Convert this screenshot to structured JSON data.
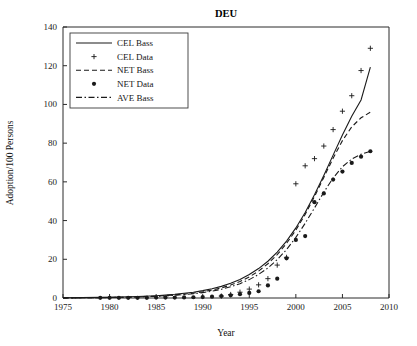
{
  "figure": {
    "title": "DEU",
    "background": "#ffffff",
    "ink": "#1a1a1a"
  },
  "chart_data": {
    "type": "line",
    "title": "DEU",
    "xlabel": "Year",
    "ylabel": "Adoption/100 Persons",
    "xlim": [
      1975,
      2010
    ],
    "ylim": [
      0,
      140
    ],
    "xticks": [
      1975,
      1980,
      1985,
      1990,
      1995,
      2000,
      2005,
      2010
    ],
    "yticks": [
      0,
      20,
      40,
      60,
      80,
      100,
      120,
      140
    ],
    "grid": false,
    "legend_position": "top-left",
    "series": [
      {
        "name": "CEL Bass",
        "style": "solid",
        "marker": "none",
        "x": [
          1975,
          1977,
          1979,
          1981,
          1983,
          1985,
          1987,
          1989,
          1990,
          1991,
          1992,
          1993,
          1994,
          1995,
          1996,
          1997,
          1998,
          1999,
          2000,
          2001,
          2002,
          2003,
          2004,
          2005,
          2006,
          2007,
          2008
        ],
        "values": [
          0.1,
          0.2,
          0.3,
          0.5,
          0.8,
          1.2,
          1.9,
          3.0,
          3.8,
          4.8,
          6.0,
          7.6,
          9.6,
          12.1,
          15.2,
          19.0,
          23.7,
          29.4,
          36.2,
          44.2,
          53.3,
          63.3,
          73.8,
          84.2,
          93.9,
          102.3,
          119.3
        ]
      },
      {
        "name": "CEL Data",
        "style": "none",
        "marker": "plus",
        "x": [
          1992,
          1993,
          1994,
          1995,
          1996,
          1997,
          1998,
          1999,
          2000,
          2001,
          2002,
          2003,
          2004,
          2005,
          2006,
          2007,
          2008
        ],
        "values": [
          1.0,
          1.8,
          3.0,
          4.6,
          6.8,
          10.0,
          17.0,
          21.0,
          59.0,
          68.3,
          72.0,
          78.5,
          87.0,
          96.5,
          104.5,
          117.5,
          129.0
        ]
      },
      {
        "name": "NET Bass",
        "style": "dashed",
        "marker": "none",
        "x": [
          1975,
          1977,
          1979,
          1981,
          1983,
          1985,
          1987,
          1989,
          1990,
          1991,
          1992,
          1993,
          1994,
          1995,
          1996,
          1997,
          1998,
          1999,
          2000,
          2001,
          2002,
          2003,
          2004,
          2005,
          2006,
          2007,
          2008
        ],
        "values": [
          0.05,
          0.1,
          0.2,
          0.35,
          0.6,
          1.0,
          1.6,
          2.5,
          3.2,
          4.1,
          5.2,
          6.7,
          8.5,
          10.9,
          13.9,
          17.7,
          22.4,
          28.2,
          35.1,
          43.2,
          52.4,
          62.3,
          72.2,
          81.3,
          88.4,
          93.1,
          96.0
        ]
      },
      {
        "name": "NET Data",
        "style": "none",
        "marker": "dot",
        "x": [
          1979,
          1980,
          1981,
          1982,
          1983,
          1984,
          1985,
          1986,
          1987,
          1988,
          1989,
          1990,
          1991,
          1992,
          1993,
          1994,
          1995,
          1996,
          1997,
          1998,
          1999,
          2000,
          2001,
          2002,
          2003,
          2004,
          2005,
          2006,
          2007,
          2008
        ],
        "values": [
          0.1,
          0.1,
          0.1,
          0.1,
          0.1,
          0.1,
          0.2,
          0.2,
          0.2,
          0.3,
          0.4,
          0.5,
          0.7,
          1.0,
          1.4,
          2.0,
          2.6,
          3.5,
          6.5,
          10.0,
          20.5,
          30.0,
          32.0,
          49.5,
          54.0,
          61.2,
          65.3,
          69.8,
          73.0,
          75.8
        ]
      },
      {
        "name": "AVE Bass",
        "style": "dashdot",
        "marker": "none",
        "x": [
          1975,
          1977,
          1979,
          1981,
          1983,
          1985,
          1987,
          1989,
          1990,
          1991,
          1992,
          1993,
          1994,
          1995,
          1996,
          1997,
          1998,
          1999,
          2000,
          2001,
          2002,
          2003,
          2004,
          2005,
          2006,
          2007,
          2008
        ],
        "values": [
          0.05,
          0.1,
          0.15,
          0.3,
          0.5,
          0.85,
          1.4,
          2.2,
          2.8,
          3.5,
          4.5,
          5.8,
          7.4,
          9.5,
          12.2,
          15.5,
          19.8,
          25.0,
          31.3,
          38.6,
          46.5,
          54.6,
          62.0,
          67.8,
          71.8,
          74.3,
          75.8
        ]
      }
    ]
  },
  "legend": {
    "items": [
      {
        "label": "CEL Bass",
        "style": "solid",
        "marker": "none"
      },
      {
        "label": "CEL Data",
        "style": "none",
        "marker": "plus"
      },
      {
        "label": "NET Bass",
        "style": "dashed",
        "marker": "none"
      },
      {
        "label": "NET Data",
        "style": "none",
        "marker": "dot"
      },
      {
        "label": "AVE Bass",
        "style": "dashdot",
        "marker": "none"
      }
    ]
  }
}
